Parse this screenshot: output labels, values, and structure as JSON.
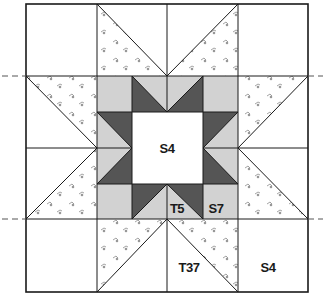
{
  "diagram": {
    "colors": {
      "background": "#ffffff",
      "light_gray": "#d2d2d2",
      "dark_gray": "#555555",
      "line": "#1a1a1a",
      "print_motif": "#8a8a8a"
    },
    "labels": {
      "center": "S4",
      "star_point": "T5",
      "star_corner": "S7",
      "outer_triangle": "T37",
      "outer_corner": "S4"
    },
    "guides": [
      "dashed-row-guide-top",
      "dashed-row-guide-bottom"
    ]
  }
}
